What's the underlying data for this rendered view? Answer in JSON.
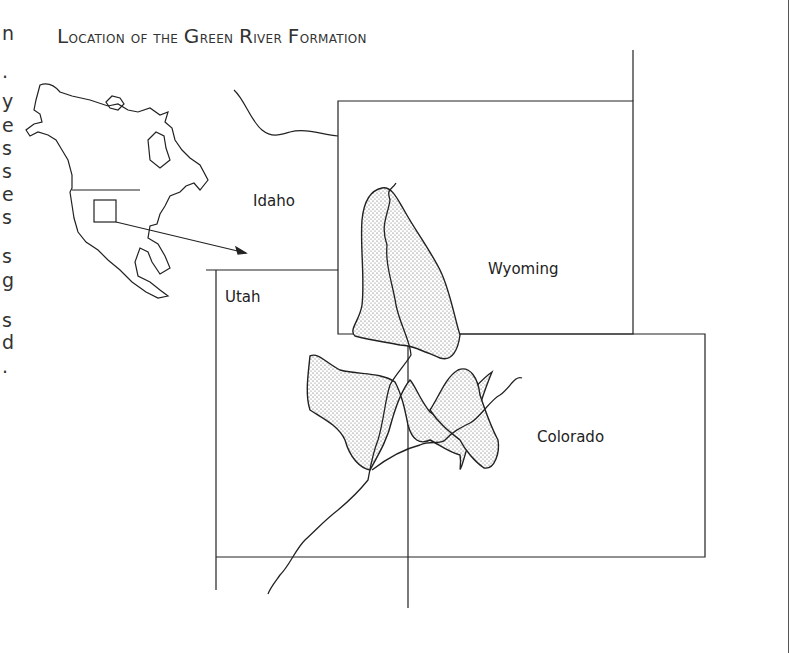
{
  "page": {
    "title": "Location of the Green River Formation",
    "title_parts": [
      {
        "cap": "L",
        "rest": "ocation of the "
      },
      {
        "cap": "G",
        "rest": "reen "
      },
      {
        "cap": "R",
        "rest": "iver "
      },
      {
        "cap": "F",
        "rest": "ormation"
      }
    ],
    "left_edge_fragments": [
      "n",
      ".",
      "y",
      "e",
      "s",
      "s",
      "e",
      "s",
      "s",
      "g",
      "s",
      "d",
      "."
    ]
  },
  "map": {
    "labels": {
      "idaho": "Idaho",
      "utah": "Utah",
      "wyoming": "Wyoming",
      "colorado": "Colorado"
    },
    "inset": "North America outline with locator box",
    "pattern": "stippled Green River Formation basins",
    "colors": {
      "line": "#222222",
      "stipple": "#444444",
      "background": "#ffffff"
    }
  }
}
